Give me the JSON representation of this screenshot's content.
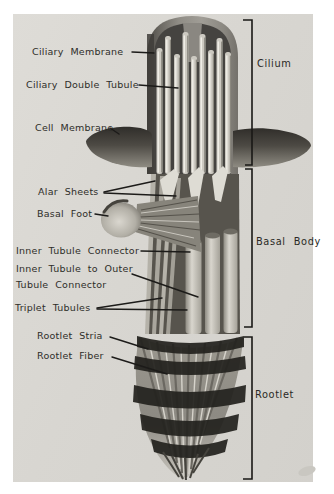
{
  "figure_type": "labeled-anatomical-diagram",
  "labels": {
    "ciliary_membrane": "Ciliary Membrane",
    "ciliary_double_tubule": "Ciliary Double Tubule",
    "cell_membrane": "Cell Membrane",
    "alar_sheets": "Alar Sheets",
    "basal_foot": "Basal Foot",
    "inner_tubule_connector": "Inner Tubule Connector",
    "inner_tubule_to_outer_line1": "Inner Tubule to Outer",
    "inner_tubule_to_outer_line2": "Tubule Connector",
    "triplet_tubules": "Triplet Tubules",
    "rootlet_stria": "Rootlet Stria",
    "rootlet_fiber": "Rootlet Fiber"
  },
  "sections": {
    "cilium": "Cilium",
    "basal_body": "Basal Body",
    "rootlet": "Rootlet"
  },
  "colors": {
    "page_bg": "#ffffff",
    "scan_bg": "#d8d6d1",
    "ink": "#1c1b19",
    "shadow_dark": "#23221e",
    "tubule_light": "#ccc9c1"
  }
}
